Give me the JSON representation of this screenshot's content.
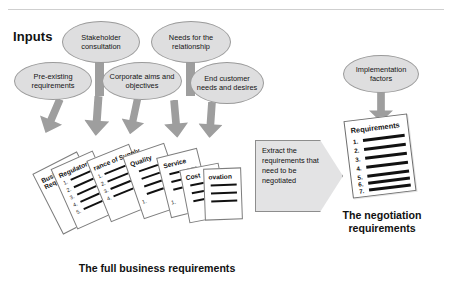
{
  "diagram": {
    "inputs_label": "Inputs",
    "top_ellipses": [
      {
        "id": "stakeholder-consultation",
        "label": "Stakeholder consultation"
      },
      {
        "id": "needs-for-the-relationship",
        "label": "Needs for the relationship"
      }
    ],
    "second_ellipses": [
      {
        "id": "pre-existing-requirements",
        "label": "Pre-existing requirements"
      },
      {
        "id": "corporate-aims-and-objectives",
        "label": "Corporate aims and objectives"
      },
      {
        "id": "end-customer-needs-and-desires",
        "label": "End customer needs and desires"
      }
    ],
    "implementation_ellipse": {
      "id": "implementation-factors",
      "label": "Implementation factors"
    },
    "cards": [
      {
        "id": "business-requirements",
        "title": "Business Requirements",
        "items": []
      },
      {
        "id": "regulatory",
        "title": "Regulatory",
        "items": [
          "1.",
          "2.",
          "3.",
          "4.",
          "5."
        ]
      },
      {
        "id": "assurance-of-supply",
        "title": "rance of Supply",
        "items": [
          "1.",
          "2.",
          "3.",
          "4."
        ]
      },
      {
        "id": "quality",
        "title": "Quality",
        "items": [
          "1.",
          "2."
        ]
      },
      {
        "id": "service",
        "title": "Service",
        "items": [
          "1.",
          "2."
        ]
      },
      {
        "id": "cost",
        "title": "Cost",
        "items": [
          "1."
        ]
      },
      {
        "id": "innovation",
        "title": "ovation",
        "items": []
      }
    ],
    "callout": {
      "id": "extract-requirements",
      "text": "Extract the requirements that need to be negotiated"
    },
    "requirements_doc": {
      "title": "Requirements",
      "items": [
        "1.",
        "2.",
        "3.",
        "4.",
        "5.",
        "6.",
        "7."
      ]
    },
    "captions": {
      "left": "The full business requirements",
      "right": "The negotiation requirements"
    },
    "colors": {
      "ellipse_fill": "#dededf",
      "ellipse_stroke": "#9a9a9a",
      "arrow_fill": "#9e9e9e",
      "callout_fill": "#e3e3e4",
      "callout_stroke": "#8d8d8d",
      "card_fill": "#ffffff",
      "card_stroke": "#7d7d7d",
      "text": "#141414",
      "rule": "#cfcfcf"
    }
  }
}
